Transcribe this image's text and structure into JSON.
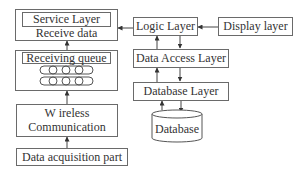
{
  "diagram": {
    "left_column": {
      "service_layer": {
        "title": "Service Layer",
        "subtitle": "Receive data"
      },
      "receiving_queue": {
        "title": "Receiving queue",
        "rows": 2,
        "cells_per_row": 4
      },
      "wireless": {
        "line1": "W ireless",
        "line2": "Communication"
      },
      "data_acquisition": {
        "label": "Data acquisition part"
      }
    },
    "right_column": {
      "logic_layer": {
        "label": "Logic Layer"
      },
      "display_layer": {
        "label": "Display layer"
      },
      "data_access_layer": {
        "label": "Data Access Layer"
      },
      "database_layer": {
        "label": "Database Layer"
      },
      "database": {
        "label": "Database"
      }
    },
    "edges": [
      {
        "from": "Data acquisition part",
        "to": "Wireless Communication"
      },
      {
        "from": "Wireless Communication",
        "to": "Receiving queue"
      },
      {
        "from": "Receiving queue",
        "to": "Service Layer"
      },
      {
        "from": "Logic Layer",
        "to": "Service Layer"
      },
      {
        "from": "Display layer",
        "to": "Logic Layer"
      },
      {
        "from": "Logic Layer",
        "to": "Data Access Layer",
        "bidirectional": true
      },
      {
        "from": "Data Access Layer",
        "to": "Database Layer",
        "bidirectional": true
      },
      {
        "from": "Database Layer",
        "to": "Database",
        "bidirectional": true
      }
    ]
  }
}
